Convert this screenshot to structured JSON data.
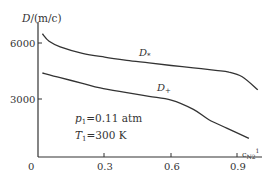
{
  "chart_data": {
    "type": "line",
    "title": "",
    "ylabel": "D/(m/c)",
    "xlabel": "c_{N2}1",
    "xlim": [
      0,
      1.0
    ],
    "ylim": [
      0,
      7000
    ],
    "x_ticks": [
      "0",
      "0.3",
      "0.6",
      "0.9"
    ],
    "y_ticks": [
      "3000",
      "6000"
    ],
    "grid": false,
    "legend": "inline labels on curves",
    "annotations": [
      "p1=0.11 atm",
      "T1=300 K"
    ],
    "series": [
      {
        "name": "D*",
        "x": [
          0.02,
          0.05,
          0.1,
          0.2,
          0.3,
          0.4,
          0.5,
          0.6,
          0.7,
          0.8,
          0.86,
          0.92,
          0.99
        ],
        "values": [
          6600,
          6200,
          5900,
          5550,
          5350,
          5180,
          5040,
          4900,
          4780,
          4640,
          4550,
          4300,
          3600
        ]
      },
      {
        "name": "D+",
        "x": [
          0.02,
          0.1,
          0.2,
          0.28,
          0.4,
          0.5,
          0.6,
          0.7,
          0.77,
          0.85,
          0.95
        ],
        "values": [
          4500,
          4250,
          3950,
          3700,
          3450,
          3250,
          3050,
          2550,
          2000,
          1550,
          1000
        ]
      }
    ]
  },
  "labels": {
    "y_axis_title_D": "D",
    "y_axis_title_unit": "/(m/c)",
    "series_star": "D",
    "series_star_sub": "*",
    "series_plus": "D",
    "series_plus_sub": "+",
    "p_var": "p",
    "p_sub": "1",
    "p_val": "=0.11 atm",
    "t_var": "T",
    "t_sub": "1",
    "t_val": "=300 K",
    "x_axis_var": "c",
    "x_axis_sub": "N2",
    "x_axis_sup": "1",
    "tick_x0": "0",
    "tick_x1": "0.3",
    "tick_x2": "0.6",
    "tick_x3": "0.9",
    "tick_y1": "3000",
    "tick_y2": "6000"
  }
}
